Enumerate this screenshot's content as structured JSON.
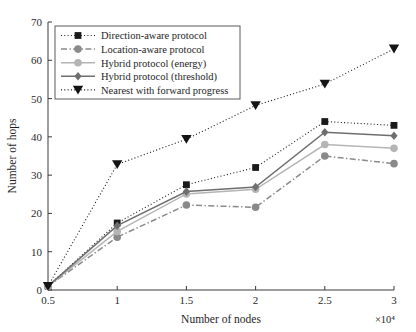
{
  "chart_data": {
    "type": "line",
    "title": "",
    "xlabel": "Number of nodes",
    "ylabel": "Number of hops",
    "x_exponent_label": "×10⁴",
    "x": [
      0.5,
      1,
      1.5,
      2,
      2.5,
      3
    ],
    "xticklabels": [
      "0.5",
      "1",
      "1.5",
      "2",
      "2.5",
      "3"
    ],
    "yticklabels": [
      "0",
      "10",
      "20",
      "30",
      "40",
      "50",
      "60",
      "70"
    ],
    "yticks": [
      0,
      10,
      20,
      30,
      40,
      50,
      60,
      70
    ],
    "xlim": [
      0.5,
      3
    ],
    "ylim": [
      0,
      70
    ],
    "grid": false,
    "legend_position": "upper left",
    "series": [
      {
        "name": "Direction-aware protocol",
        "marker": "square",
        "linestyle": "dotted",
        "color": "#1a1a1a",
        "values": [
          1,
          17.5,
          27.5,
          32,
          44,
          43
        ]
      },
      {
        "name": "Location-aware protocol",
        "marker": "circle",
        "linestyle": "dashdot",
        "color": "#8a8a8a",
        "values": [
          1,
          13.8,
          22.2,
          21.6,
          35,
          33
        ]
      },
      {
        "name": "Hybrid protocol (energy)",
        "marker": "circle",
        "linestyle": "solid",
        "color": "#b5b5b5",
        "values": [
          1,
          15.3,
          25.1,
          26.3,
          38,
          37
        ]
      },
      {
        "name": "Hybrid protocol (threshold)",
        "marker": "diamond",
        "linestyle": "solid",
        "color": "#6e6e6e",
        "values": [
          1,
          16.8,
          25.7,
          26.9,
          41.2,
          40.3
        ]
      },
      {
        "name": "Nearest with forward progress",
        "marker": "triangle-down",
        "linestyle": "dotted",
        "color": "#141414",
        "values": [
          1,
          32.8,
          39.4,
          48.2,
          53.8,
          63
        ]
      }
    ]
  }
}
